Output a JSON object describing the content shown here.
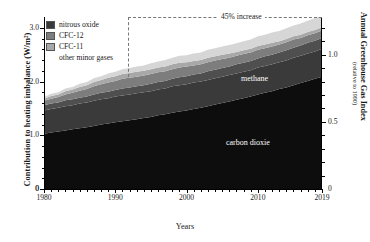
{
  "chart_data": {
    "type": "area",
    "title": "",
    "xlabel": "Years",
    "ylabel": "Contribution to heating imbalance (W/m²)",
    "ylabel_right": "Annual Greenhouse Gas Index",
    "ylabel_right_sub": "(relative to 1990)",
    "xlim": [
      1980,
      2019
    ],
    "ylim": [
      0,
      3.2
    ],
    "ylim_right": [
      0,
      1.28
    ],
    "grid": false,
    "stacked": true,
    "legend_position": "top-left",
    "xticks": [
      1980,
      1990,
      2000,
      2010,
      2019
    ],
    "xtick_labels": [
      "1980",
      "1990",
      "2000",
      "2010",
      "2019"
    ],
    "yticks_left": [
      0,
      1.0,
      2.0,
      3.0
    ],
    "ytick_labels_left": [
      "0",
      "1.0",
      "2.0",
      "3.0"
    ],
    "yticks_right": [
      0.5,
      1.0
    ],
    "ytick_labels_right": [
      "0.5",
      "1.0"
    ],
    "x": [
      1980,
      1981,
      1982,
      1983,
      1984,
      1985,
      1986,
      1987,
      1988,
      1989,
      1990,
      1991,
      1992,
      1993,
      1994,
      1995,
      1996,
      1997,
      1998,
      1999,
      2000,
      2001,
      2002,
      2003,
      2004,
      2005,
      2006,
      2007,
      2008,
      2009,
      2010,
      2011,
      2012,
      2013,
      2014,
      2015,
      2016,
      2017,
      2018,
      2019
    ],
    "series": [
      {
        "name": "carbon dioxide",
        "color": "#0d0d0d",
        "values": [
          1.03,
          1.05,
          1.07,
          1.09,
          1.11,
          1.13,
          1.15,
          1.17,
          1.2,
          1.22,
          1.24,
          1.26,
          1.28,
          1.3,
          1.32,
          1.34,
          1.37,
          1.39,
          1.42,
          1.44,
          1.46,
          1.49,
          1.51,
          1.54,
          1.57,
          1.6,
          1.63,
          1.66,
          1.69,
          1.72,
          1.76,
          1.79,
          1.82,
          1.86,
          1.89,
          1.93,
          1.97,
          2.01,
          2.05,
          2.09
        ]
      },
      {
        "name": "methane",
        "color": "#3a3a3a",
        "values": [
          0.43,
          0.44,
          0.44,
          0.45,
          0.45,
          0.46,
          0.46,
          0.47,
          0.47,
          0.47,
          0.48,
          0.48,
          0.48,
          0.48,
          0.48,
          0.48,
          0.48,
          0.48,
          0.49,
          0.49,
          0.49,
          0.49,
          0.49,
          0.49,
          0.49,
          0.49,
          0.49,
          0.49,
          0.49,
          0.49,
          0.5,
          0.5,
          0.5,
          0.5,
          0.5,
          0.51,
          0.51,
          0.51,
          0.51,
          0.52
        ]
      },
      {
        "name": "nitrous oxide",
        "color": "#4f4f4f",
        "values": [
          0.1,
          0.1,
          0.1,
          0.11,
          0.11,
          0.11,
          0.11,
          0.12,
          0.12,
          0.12,
          0.12,
          0.13,
          0.13,
          0.13,
          0.13,
          0.14,
          0.14,
          0.14,
          0.14,
          0.15,
          0.15,
          0.15,
          0.15,
          0.16,
          0.16,
          0.16,
          0.16,
          0.17,
          0.17,
          0.17,
          0.17,
          0.18,
          0.18,
          0.18,
          0.19,
          0.19,
          0.19,
          0.2,
          0.2,
          0.2
        ]
      },
      {
        "name": "CFC-12",
        "color": "#7d7d7d",
        "values": [
          0.08,
          0.09,
          0.1,
          0.11,
          0.12,
          0.13,
          0.14,
          0.15,
          0.16,
          0.17,
          0.17,
          0.18,
          0.18,
          0.18,
          0.18,
          0.18,
          0.18,
          0.18,
          0.18,
          0.18,
          0.18,
          0.17,
          0.17,
          0.17,
          0.17,
          0.17,
          0.16,
          0.16,
          0.16,
          0.16,
          0.16,
          0.15,
          0.15,
          0.15,
          0.15,
          0.15,
          0.14,
          0.14,
          0.14,
          0.14
        ]
      },
      {
        "name": "CFC-11",
        "color": "#a8a8a8",
        "values": [
          0.04,
          0.05,
          0.05,
          0.06,
          0.06,
          0.07,
          0.07,
          0.08,
          0.08,
          0.09,
          0.09,
          0.09,
          0.09,
          0.09,
          0.09,
          0.09,
          0.09,
          0.09,
          0.09,
          0.09,
          0.08,
          0.08,
          0.08,
          0.08,
          0.08,
          0.08,
          0.08,
          0.07,
          0.07,
          0.07,
          0.07,
          0.07,
          0.07,
          0.06,
          0.06,
          0.06,
          0.06,
          0.06,
          0.06,
          0.06
        ]
      },
      {
        "name": "other minor gases",
        "color": "#d6d6d6",
        "values": [
          0.03,
          0.04,
          0.04,
          0.05,
          0.05,
          0.06,
          0.06,
          0.07,
          0.07,
          0.08,
          0.08,
          0.09,
          0.09,
          0.1,
          0.1,
          0.11,
          0.11,
          0.12,
          0.12,
          0.13,
          0.13,
          0.14,
          0.14,
          0.15,
          0.15,
          0.15,
          0.16,
          0.16,
          0.17,
          0.17,
          0.18,
          0.18,
          0.19,
          0.19,
          0.2,
          0.2,
          0.21,
          0.21,
          0.22,
          0.22
        ]
      }
    ],
    "legend": [
      {
        "label": "nitrous oxide",
        "color": "#3a3a3a",
        "swatch": true
      },
      {
        "label": "CFC-12",
        "color": "#7d7d7d",
        "swatch": true
      },
      {
        "label": "CFC-11",
        "color": "#a8a8a8",
        "swatch": true
      },
      {
        "label": "other minor gases",
        "color": "#d6d6d6",
        "swatch": false
      }
    ],
    "annotations": [
      {
        "name": "percent-increase",
        "text": "45% increase",
        "x": 2005,
        "y": 3.2
      },
      {
        "name": "band-label-methane",
        "text": "methane",
        "x": 2003,
        "y": 1.85
      },
      {
        "name": "band-label-carbon-dioxide",
        "text": "carbon dioxie",
        "x": 2001,
        "y": 0.72
      }
    ]
  }
}
